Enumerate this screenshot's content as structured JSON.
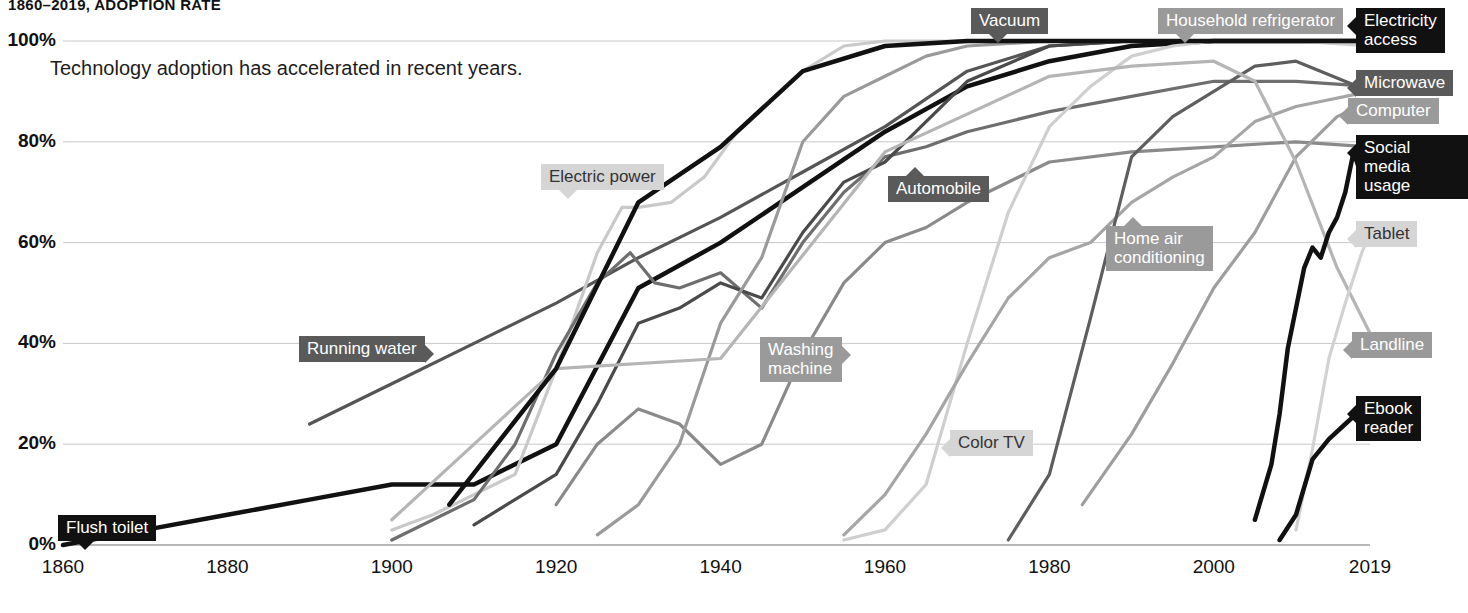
{
  "chart_title": "1860–2019, ADOPTION RATE",
  "subtitle": "Technology adoption has accelerated in recent years.",
  "axes": {
    "y_ticks": [
      "0%",
      "20%",
      "40%",
      "60%",
      "80%",
      "100%"
    ],
    "x_ticks": [
      "1860",
      "1880",
      "1900",
      "1920",
      "1940",
      "1960",
      "1980",
      "2000",
      "2019"
    ]
  },
  "chart_data": {
    "type": "line",
    "title": "1860–2019, ADOPTION RATE",
    "subtitle": "Technology adoption has accelerated in recent years.",
    "xlabel": "",
    "ylabel": "Adoption rate",
    "xlim": [
      1860,
      2019
    ],
    "ylim": [
      0,
      100
    ],
    "grid": true,
    "legend": "inline-callout-labels",
    "y_ticks": [
      0,
      20,
      40,
      60,
      80,
      100
    ],
    "x_ticks": [
      1860,
      1880,
      1900,
      1920,
      1940,
      1960,
      1980,
      2000,
      2019
    ],
    "series": [
      {
        "name": "Flush toilet",
        "color": "#111111",
        "label_style": "black",
        "label_tail": "down",
        "x": [
          1860,
          1870,
          1880,
          1890,
          1900,
          1910,
          1920,
          1930,
          1940,
          1950,
          1960,
          1970,
          1980,
          1990,
          2000,
          2010,
          2019
        ],
        "y": [
          0,
          3,
          6,
          9,
          12,
          12,
          20,
          51,
          60,
          71,
          82,
          91,
          96,
          99,
          100,
          100,
          100
        ]
      },
      {
        "name": "Running water",
        "color": "#555555",
        "label_style": "dark",
        "label_tail": "right",
        "x": [
          1890,
          1900,
          1910,
          1920,
          1930,
          1940,
          1950,
          1960,
          1970,
          1980,
          1990,
          2000,
          2010,
          2019
        ],
        "y": [
          24,
          32,
          40,
          48,
          57,
          65,
          74,
          83,
          94,
          99,
          100,
          100,
          100,
          100
        ]
      },
      {
        "name": "Electric power",
        "color": "#c9c9c9",
        "label_style": "light",
        "label_tail": "down",
        "x": [
          1900,
          1905,
          1910,
          1915,
          1920,
          1925,
          1928,
          1930,
          1934,
          1938,
          1942,
          1946,
          1950,
          1955,
          1960,
          1970,
          1980,
          1990,
          2000,
          2019
        ],
        "y": [
          3,
          6,
          10,
          14,
          35,
          58,
          67,
          67,
          68,
          73,
          82,
          88,
          94,
          99,
          100,
          100,
          100,
          100,
          100,
          100
        ]
      },
      {
        "name": "Automobile",
        "color": "#6e6e6e",
        "label_style": "dark",
        "label_tail": "up",
        "x": [
          1900,
          1910,
          1915,
          1920,
          1925,
          1929,
          1932,
          1935,
          1940,
          1945,
          1950,
          1955,
          1960,
          1965,
          1970,
          1980,
          1990,
          2000,
          2010,
          2019
        ],
        "y": [
          1,
          9,
          20,
          38,
          52,
          58,
          52,
          51,
          54,
          47,
          60,
          70,
          77,
          79,
          82,
          86,
          89,
          92,
          92,
          91
        ]
      },
      {
        "name": "Vacuum",
        "color": "#4a4a4a",
        "label_style": "dark",
        "label_tail": "down",
        "x": [
          1910,
          1920,
          1925,
          1930,
          1935,
          1940,
          1945,
          1950,
          1955,
          1960,
          1965,
          1970,
          1980,
          1990,
          2000,
          2010,
          2019
        ],
        "y": [
          4,
          14,
          28,
          44,
          47,
          52,
          49,
          62,
          72,
          76,
          84,
          92,
          99,
          100,
          100,
          100,
          100
        ]
      },
      {
        "name": "Washing machine",
        "color": "#8a8a8a",
        "label_style": "mid",
        "label_tail": "right",
        "x": [
          1920,
          1925,
          1930,
          1935,
          1940,
          1945,
          1950,
          1955,
          1960,
          1965,
          1970,
          1980,
          1990,
          2000,
          2010,
          2019
        ],
        "y": [
          8,
          20,
          27,
          24,
          16,
          20,
          38,
          52,
          60,
          63,
          68,
          76,
          78,
          79,
          80,
          79
        ]
      },
      {
        "name": "Household refrigerator",
        "color": "#9a9a9a",
        "label_style": "mid",
        "label_tail": "down",
        "x": [
          1925,
          1930,
          1935,
          1940,
          1945,
          1950,
          1955,
          1960,
          1965,
          1970,
          1980,
          1990,
          2000,
          2010,
          2019
        ],
        "y": [
          2,
          8,
          20,
          44,
          57,
          80,
          89,
          93,
          97,
          99,
          100,
          100,
          100,
          100,
          100
        ]
      },
      {
        "name": "Color TV",
        "color": "#cfcfcf",
        "label_style": "light",
        "label_tail": "left",
        "x": [
          1955,
          1960,
          1965,
          1970,
          1975,
          1980,
          1985,
          1990,
          1995,
          2000,
          2010,
          2019
        ],
        "y": [
          1,
          3,
          12,
          40,
          66,
          83,
          91,
          97,
          99,
          100,
          100,
          99
        ]
      },
      {
        "name": "Home air conditioning",
        "color": "#a5a5a5",
        "label_style": "mid",
        "label_tail": "up",
        "x": [
          1955,
          1960,
          1965,
          1970,
          1975,
          1980,
          1985,
          1990,
          1995,
          2000,
          2005,
          2010,
          2019
        ],
        "y": [
          2,
          10,
          22,
          36,
          49,
          57,
          60,
          68,
          73,
          77,
          84,
          87,
          90
        ]
      },
      {
        "name": "Microwave",
        "color": "#5e5e5e",
        "label_style": "dark",
        "label_tail": "left",
        "x": [
          1975,
          1980,
          1985,
          1990,
          1995,
          2000,
          2005,
          2010,
          2019
        ],
        "y": [
          1,
          14,
          45,
          77,
          85,
          90,
          95,
          96,
          90
        ]
      },
      {
        "name": "Computer",
        "color": "#9e9e9e",
        "label_style": "mid",
        "label_tail": "left",
        "x": [
          1984,
          1990,
          1995,
          2000,
          2005,
          2010,
          2015,
          2019
        ],
        "y": [
          8,
          22,
          36,
          51,
          62,
          77,
          85,
          88
        ]
      },
      {
        "name": "Landline",
        "color": "#b5b5b5",
        "label_style": "mid",
        "label_tail": "left",
        "x": [
          1900,
          1920,
          1940,
          1960,
          1980,
          1990,
          2000,
          2005,
          2010,
          2015,
          2019
        ],
        "y": [
          5,
          35,
          37,
          78,
          93,
          95,
          96,
          92,
          76,
          55,
          42
        ]
      },
      {
        "name": "Electricity access",
        "color": "#111111",
        "label_style": "black",
        "label_tail": "left",
        "x": [
          1907,
          1920,
          1930,
          1940,
          1950,
          1960,
          1970,
          1980,
          1990,
          2000,
          2010,
          2019
        ],
        "y": [
          8,
          35,
          68,
          79,
          94,
          99,
          100,
          100,
          100,
          100,
          100,
          100
        ]
      },
      {
        "name": "Social media usage",
        "color": "#111111",
        "label_style": "black",
        "label_tail": "left",
        "x": [
          2005,
          2007,
          2008,
          2009,
          2010,
          2011,
          2012,
          2013,
          2014,
          2015,
          2016,
          2017,
          2018,
          2019
        ],
        "y": [
          5,
          16,
          26,
          39,
          47,
          55,
          59,
          57,
          62,
          65,
          70,
          78,
          73,
          80
        ]
      },
      {
        "name": "Tablet",
        "color": "#d2d2d2",
        "label_style": "light",
        "label_tail": "left",
        "x": [
          2010,
          2012,
          2014,
          2016,
          2018,
          2019
        ],
        "y": [
          3,
          19,
          37,
          48,
          58,
          62
        ]
      },
      {
        "name": "Ebook reader",
        "color": "#111111",
        "label_style": "black",
        "label_tail": "left",
        "x": [
          2008,
          2010,
          2012,
          2014,
          2016,
          2018,
          2019
        ],
        "y": [
          1,
          6,
          17,
          21,
          24,
          27,
          28
        ]
      }
    ],
    "callouts": [
      {
        "name": "Flush toilet",
        "text": "Flush toilet",
        "x": 58,
        "y": 515,
        "style": "black",
        "tail": "down"
      },
      {
        "name": "Running water",
        "text": "Running water",
        "x": 299,
        "y": 336,
        "style": "dark",
        "tail": "right"
      },
      {
        "name": "Electric power",
        "text": "Electric power",
        "x": 541,
        "y": 164,
        "style": "light",
        "tail": "down"
      },
      {
        "name": "Automobile",
        "text": "Automobile",
        "x": 888,
        "y": 176,
        "style": "dark",
        "tail": "up"
      },
      {
        "name": "Vacuum",
        "text": "Vacuum",
        "x": 971,
        "y": 8,
        "style": "dark",
        "tail": "down"
      },
      {
        "name": "Washing machine",
        "text": "Washing\nmachine",
        "x": 760,
        "y": 337,
        "style": "mid",
        "tail": "right"
      },
      {
        "name": "Household refrigerator",
        "text": "Household refrigerator",
        "x": 1158,
        "y": 8,
        "style": "mid",
        "tail": "down"
      },
      {
        "name": "Color TV",
        "text": "Color TV",
        "x": 950,
        "y": 430,
        "style": "light",
        "tail": "left"
      },
      {
        "name": "Home air conditioning",
        "text": "Home air\nconditioning",
        "x": 1106,
        "y": 226,
        "style": "mid",
        "tail": "up"
      },
      {
        "name": "Electricity access",
        "text": "Electricity\naccess",
        "x": 1356,
        "y": 8,
        "style": "black",
        "tail": "left"
      },
      {
        "name": "Microwave",
        "text": "Microwave",
        "x": 1356,
        "y": 70,
        "style": "dark",
        "tail": "left"
      },
      {
        "name": "Computer",
        "text": "Computer",
        "x": 1348,
        "y": 98,
        "style": "mid",
        "tail": "left"
      },
      {
        "name": "Social media usage",
        "text": "Social media\nusage",
        "x": 1356,
        "y": 135,
        "style": "black",
        "tail": "left"
      },
      {
        "name": "Tablet",
        "text": "Tablet",
        "x": 1356,
        "y": 221,
        "style": "light",
        "tail": "left"
      },
      {
        "name": "Landline",
        "text": "Landline",
        "x": 1352,
        "y": 332,
        "style": "mid",
        "tail": "left"
      },
      {
        "name": "Ebook reader",
        "text": "Ebook\nreader",
        "x": 1356,
        "y": 396,
        "style": "black",
        "tail": "left"
      }
    ],
    "styles": {
      "black": {
        "bg": "#111111",
        "fg": "#ffffff"
      },
      "dark": {
        "bg": "#5a5a5a",
        "fg": "#ffffff"
      },
      "mid": {
        "bg": "#9a9a9a",
        "fg": "#ffffff"
      },
      "light": {
        "bg": "#d5d5d5",
        "fg": "#333333"
      }
    }
  }
}
